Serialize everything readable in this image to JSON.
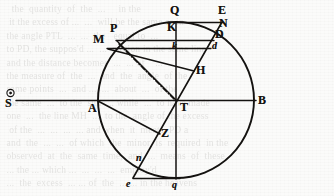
{
  "figure": {
    "type": "astronomical-geometric-diagram",
    "ink_color": "#141210",
    "paper_color": "#fbfbfa",
    "circle": {
      "cx": 176,
      "cy": 100,
      "r": 78
    },
    "points": [
      {
        "id": "S",
        "label": "S",
        "case": "capital",
        "x": 10,
        "y": 101,
        "label_x": 5,
        "label_y": 104,
        "note": "sun symbol above label, outside circle at left"
      },
      {
        "id": "A",
        "label": "A",
        "case": "capital",
        "x": 98,
        "y": 100,
        "label_x": 92,
        "label_y": 101
      },
      {
        "id": "B",
        "label": "B",
        "case": "capital",
        "x": 254,
        "y": 100,
        "label_x": 258,
        "label_y": 101
      },
      {
        "id": "T",
        "label": "T",
        "case": "capital",
        "x": 176,
        "y": 100,
        "label_x": 180,
        "label_y": 105
      },
      {
        "id": "Q",
        "label": "Q",
        "case": "capital",
        "x": 176,
        "y": 22,
        "label_x": 171,
        "label_y": 9
      },
      {
        "id": "q",
        "label": "q",
        "case": "lower",
        "x": 176,
        "y": 178,
        "label_x": 173,
        "label_y": 184
      },
      {
        "id": "E",
        "label": "E",
        "case": "capital",
        "x": 222,
        "y": 22,
        "label_x": 219,
        "label_y": 9
      },
      {
        "id": "N",
        "label": "N",
        "case": "capital",
        "x": 220,
        "y": 31,
        "label_x": 220,
        "label_y": 21
      },
      {
        "id": "D",
        "label": "D",
        "case": "capital",
        "x": 213,
        "y": 40,
        "label_x": 216,
        "label_y": 31
      },
      {
        "id": "d",
        "label": "d",
        "case": "lower",
        "x": 210,
        "y": 48,
        "label_x": 212,
        "label_y": 42
      },
      {
        "id": "K",
        "label": "K",
        "case": "capital",
        "x": 176,
        "y": 40,
        "label_x": 169,
        "label_y": 24
      },
      {
        "id": "k",
        "label": "k",
        "case": "lower",
        "x": 176,
        "y": 48,
        "label_x": 172,
        "label_y": 43
      },
      {
        "id": "P",
        "label": "P",
        "case": "capital",
        "x": 117,
        "y": 40,
        "label_x": 112,
        "label_y": 26
      },
      {
        "id": "M",
        "label": "M",
        "case": "capital",
        "x": 108,
        "y": 48,
        "label_x": 97,
        "label_y": 38
      },
      {
        "id": "H",
        "label": "H",
        "case": "capital",
        "x": 193,
        "y": 70,
        "label_x": 196,
        "label_y": 67
      },
      {
        "id": "Z",
        "label": "Z",
        "case": "capital",
        "x": 159,
        "y": 133,
        "label_x": 161,
        "label_y": 130
      },
      {
        "id": "n",
        "label": "n",
        "case": "lower",
        "x": 141,
        "y": 162,
        "label_x": 138,
        "label_y": 156
      },
      {
        "id": "e",
        "label": "e",
        "case": "lower",
        "x": 133,
        "y": 178,
        "label_x": 128,
        "label_y": 181
      }
    ],
    "segments": [
      {
        "name": "sun-to-B-axis",
        "from": "S",
        "to": "B",
        "style": "solid"
      },
      {
        "name": "vertical-axis",
        "from": "Q",
        "to": "q",
        "style": "solid"
      },
      {
        "name": "chord-P-D",
        "from": "P",
        "to": "D",
        "style": "solid"
      },
      {
        "name": "chord-M-d",
        "from": "M",
        "to": "d",
        "style": "solid"
      },
      {
        "name": "top-line-Q-E",
        "from": "Q",
        "to": "E",
        "style": "solid"
      },
      {
        "name": "line-E-to-e",
        "from": "E",
        "to": "e",
        "style": "solid"
      },
      {
        "name": "line-T-to-N",
        "from": "T",
        "to": "N",
        "style": "solid"
      },
      {
        "name": "line-P-to-T",
        "from": "P",
        "to": "T",
        "style": "solid"
      },
      {
        "name": "line-M-to-H",
        "from": "M",
        "to": "H",
        "style": "solid"
      },
      {
        "name": "line-A-to-Z",
        "from": "A",
        "to": "Z",
        "style": "solid"
      },
      {
        "name": "bottom-line-e-q",
        "from": "e",
        "to": "q",
        "style": "solid"
      },
      {
        "name": "dash-dot-P-to-T",
        "from": "P",
        "to": "T",
        "style": "dash-dot"
      }
    ],
    "icons": {
      "sun_symbol": "☉"
    }
  },
  "bleed_text": "   the  quantity  of  the  ...     in the    \n  it the excess of ...  ...  will be the same as in\n the angle PTL  ...  ...  the   equal to  ...\n to PD, the suppos'd ...  ...  motion in the same line\n and the distance becomes  ...  ... of    ...\n the measure of  the  ...  and  the  angle  of the\n same points  ...  and ...  ...  about  ...  of the\n the same  ...  to the  sun  ... while  ...  to have made\n one  ...  the line MH  ...  to the  angle of the excess\n  of the  ...  ...  ...  ... and when  it  meets  PD a\n and  the  ...  ...  of which  the  minor  is  required  in the\n observed  at  the  same  time,  and  ...  means  of  these\n ... the ... which ...  ...  ...  ...  employ'd\n ...  the  excess  ... ... of  the  ... ... in the heavens"
}
